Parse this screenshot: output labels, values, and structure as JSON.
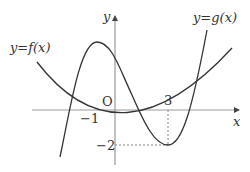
{
  "diagram": {
    "type": "function-graph",
    "axes": {
      "x_label": "x",
      "y_label": "y",
      "origin_label": "O"
    },
    "tick_labels": {
      "x_neg1": "−1",
      "x_3": "3",
      "y_neg2": "−2"
    },
    "curves": [
      {
        "name": "f",
        "label": "y=f(x)",
        "kind": "parabola"
      },
      {
        "name": "g",
        "label": "y=g(x)",
        "kind": "cubic"
      }
    ],
    "guides": [
      {
        "type": "dashed-vertical",
        "at_x": 3,
        "from_y": 0,
        "to_y": -2
      },
      {
        "type": "dashed-horizontal",
        "at_y": -2,
        "from_x": 0,
        "to_x": 3
      }
    ],
    "colors": {
      "axis": "#999999",
      "curve": "#333333",
      "guide": "#777777"
    }
  }
}
